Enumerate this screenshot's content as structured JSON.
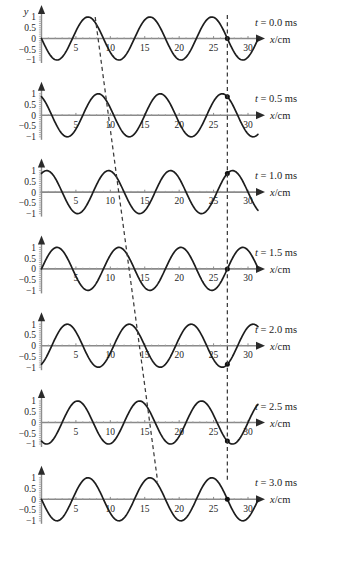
{
  "figure": {
    "y_axis_label": "y",
    "x_axis_label": "x/cm",
    "x_axis_label_italic_part": "x",
    "x_axis_label_rest": "/cm"
  },
  "chart_data": {
    "type": "line",
    "xlabel": "x/cm",
    "ylabel": "y",
    "xlim": [
      0,
      31.5
    ],
    "ylim": [
      -1,
      1
    ],
    "grid": false,
    "legend": "none",
    "x_ticks": [
      5,
      10,
      15,
      20,
      25,
      30
    ],
    "x_tick_labels": [
      "5",
      "10",
      "15",
      "20",
      "25",
      "30"
    ],
    "y_ticks": [
      1,
      0.5,
      0,
      -0.5,
      -1
    ],
    "y_tick_labels": [
      "1",
      "0.5",
      "0",
      "-0.5",
      "-1"
    ],
    "wavelength_cm": 9,
    "period_ms": 3.0,
    "wave_speed_cm_per_ms": 3,
    "direction": "rightward (+x)",
    "amplitude": 1,
    "tracked_particle_x_cm": 27,
    "panels": [
      {
        "time_label": "t = 0.0 ms",
        "time_value_ms": 0.0,
        "time_prefix": "t",
        "time_rest": "= 0.0 ms",
        "phase_shift_cm": 0.0,
        "crest_x_cm": 7.8,
        "tracked_particle_y": 1.0,
        "marker_dot": true
      },
      {
        "time_label": "t = 0.5 ms",
        "time_value_ms": 0.5,
        "time_prefix": "t",
        "time_rest": "= 0.5 ms",
        "phase_shift_cm": 1.5,
        "crest_x_cm": 9.3,
        "tracked_particle_y": 0.34,
        "marker_dot": true
      },
      {
        "time_label": "t = 1.0 ms",
        "time_value_ms": 1.0,
        "time_prefix": "t",
        "time_rest": "= 1.0 ms",
        "phase_shift_cm": 3.0,
        "crest_x_cm": 10.8,
        "tracked_particle_y": -0.72,
        "marker_dot": true
      },
      {
        "time_label": "t = 1.5 ms",
        "time_value_ms": 1.5,
        "time_prefix": "t",
        "time_rest": "= 1.5 ms",
        "phase_shift_cm": 4.5,
        "crest_x_cm": 12.3,
        "tracked_particle_y": -1.0,
        "marker_dot": true
      },
      {
        "time_label": "t = 2.0 ms",
        "time_value_ms": 2.0,
        "time_prefix": "t",
        "time_rest": "= 2.0 ms",
        "phase_shift_cm": 6.0,
        "crest_x_cm": 13.8,
        "tracked_particle_y": -0.62,
        "marker_dot": true
      },
      {
        "time_label": "t = 2.5 ms",
        "time_value_ms": 2.5,
        "time_prefix": "t",
        "time_rest": "= 2.5 ms",
        "phase_shift_cm": 7.5,
        "crest_x_cm": 15.3,
        "tracked_particle_y": 0.86,
        "marker_dot": true
      },
      {
        "time_label": "t = 3.0 ms",
        "time_value_ms": 3.0,
        "time_prefix": "t",
        "time_rest": "= 3.0 ms",
        "phase_shift_cm": 9.0,
        "crest_x_cm": 16.8,
        "tracked_particle_y": 1.0,
        "marker_dot": true
      }
    ],
    "annotations": [
      {
        "name": "crest-tracking-line",
        "type": "slanted-dashed-line",
        "description": "Dashed line connecting the same crest as it advances to the right with increasing time"
      },
      {
        "name": "particle-tracking-line",
        "type": "vertical-dashed-line",
        "description": "Vertical dashed line at x = 27 cm marking one particle oscillating up and down"
      }
    ]
  }
}
